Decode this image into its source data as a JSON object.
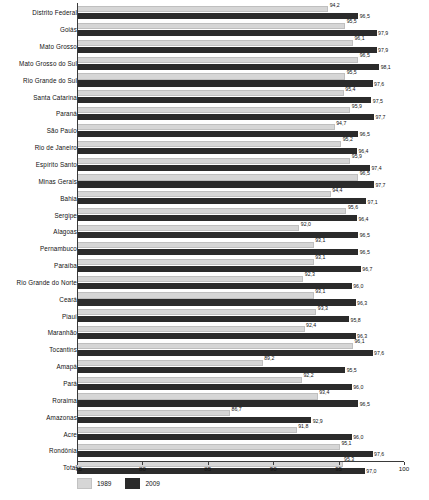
{
  "chart_data": {
    "type": "bar",
    "orientation": "horizontal",
    "title": "",
    "xlabel": "",
    "ylabel": "",
    "xlim": [
      75,
      100
    ],
    "xticks": [
      75,
      80,
      85,
      90,
      95,
      100
    ],
    "xtick_labels": [
      "75",
      "80",
      "85",
      "90",
      "95",
      "100"
    ],
    "grid": false,
    "legend_position": "bottom-left",
    "decimal_separator": ",",
    "categories": [
      "Distrito Federal",
      "Goiás",
      "Mato Grosso",
      "Mato Grosso do Sul",
      "Rio Grande do Sul",
      "Santa Catarina",
      "Paraná",
      "São Paulo",
      "Rio de Janeiro",
      "Espírito Santo",
      "Minas Gerais",
      "Bahia",
      "Sergipe",
      "Alagoas",
      "Pernambuco",
      "Paraíba",
      "Rio Grande do Norte",
      "Ceará",
      "Piauí",
      "Maranhão",
      "Tocantins",
      "Amapá",
      "Pará",
      "Roraima",
      "Amazonas",
      "Acre",
      "Rondônia",
      "Total"
    ],
    "series": [
      {
        "name": "1989",
        "color": "#d6d6d6",
        "values": [
          94.2,
          95.5,
          96.1,
          96.5,
          95.5,
          95.4,
          95.9,
          94.7,
          95.2,
          95.9,
          96.5,
          94.4,
          95.6,
          92.0,
          93.1,
          93.1,
          92.3,
          93.1,
          93.3,
          92.4,
          96.1,
          89.2,
          92.2,
          93.4,
          86.7,
          91.8,
          95.1,
          95.3
        ],
        "labels": [
          "94,2",
          "95,5",
          "96,1",
          "96,5",
          "95,5",
          "95,4",
          "95,9",
          "94,7",
          "95,2",
          "95,9",
          "96,5",
          "94,4",
          "95,6",
          "92,0",
          "93,1",
          "93,1",
          "92,3",
          "93,1",
          "93,3",
          "92,4",
          "96,1",
          "89,2",
          "92,2",
          "93,4",
          "86,7",
          "91,8",
          "95,1",
          "95,3"
        ]
      },
      {
        "name": "2009",
        "color": "#2b2b2b",
        "values": [
          96.5,
          97.9,
          97.9,
          98.1,
          97.6,
          97.5,
          97.7,
          96.5,
          96.4,
          97.4,
          97.7,
          97.1,
          96.4,
          96.5,
          96.5,
          96.7,
          96.0,
          96.3,
          95.8,
          96.3,
          97.6,
          95.5,
          96.0,
          96.5,
          92.9,
          96.0,
          97.6,
          97.0
        ],
        "labels": [
          "96,5",
          "97,9",
          "97,9",
          "98,1",
          "97,6",
          "97,5",
          "97,7",
          "96,5",
          "96,4",
          "97,4",
          "97,7",
          "97,1",
          "96,4",
          "96,5",
          "96,5",
          "96,7",
          "96,0",
          "96,3",
          "95,8",
          "96,3",
          "97,6",
          "95,5",
          "96,0",
          "96,5",
          "92,9",
          "96,0",
          "97,6",
          "97,0"
        ]
      }
    ],
    "legend": [
      {
        "label": "1989",
        "color": "#d6d6d6"
      },
      {
        "label": "2009",
        "color": "#2b2b2b"
      }
    ]
  }
}
